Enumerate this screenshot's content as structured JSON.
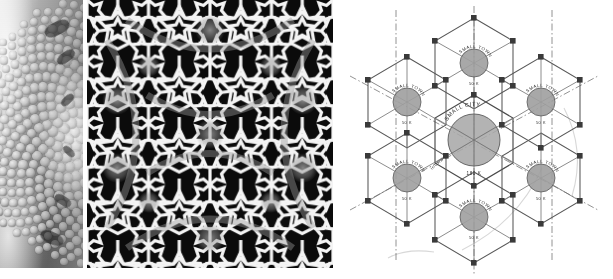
{
  "figure": {
    "background_color": "#ffffff",
    "panel_count": 3
  },
  "panels": [
    {
      "id": "phyllotaxis-photograph",
      "name": "flower-head-photo",
      "caption": "",
      "kind": "natural-image",
      "description": "grayscale close-up of a flower head showing spiral floret packing",
      "background_color": "#b9b9b9"
    },
    {
      "id": "girih-tiling",
      "name": "islamic-star-pattern",
      "caption": "",
      "kind": "pattern",
      "description": "black and white interlaced geometric star tiling",
      "background_color": "#0b0b0b",
      "line_color": "#f2f2f2",
      "shade_color": "#8a8a8a"
    },
    {
      "id": "central-place-diagram",
      "name": "christaller-hexagon-diagram",
      "caption": "",
      "kind": "diagram",
      "background_color": "#ffffff",
      "line_color": "#4a4a4a"
    }
  ],
  "central_place": {
    "center": {
      "label": "SMALL CITY",
      "population": "180 K",
      "radius": 26
    },
    "route_label": "HIGHWAY",
    "satellites": [
      {
        "position": "north",
        "label": "SMALL TOWN",
        "population": "50 K"
      },
      {
        "position": "northeast",
        "label": "SMALL TOWN",
        "population": "50 K"
      },
      {
        "position": "southeast",
        "label": "SMALL TOWN",
        "population": "50 K"
      },
      {
        "position": "south",
        "label": "SMALL TOWN",
        "population": "50 K"
      },
      {
        "position": "southwest",
        "label": "SMALL TOWN",
        "population": "50 K"
      },
      {
        "position": "northwest",
        "label": "SMALL TOWN",
        "population": "50 K"
      }
    ],
    "hexagon_count": 7,
    "spokes_per_place": 6
  }
}
